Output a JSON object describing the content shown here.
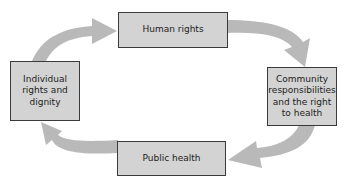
{
  "colors": {
    "background": "#ffffff",
    "box_fill": "#d3d3d3",
    "box_border": "#3a3a3a",
    "arrow": "#b9b9b9",
    "text": "#222222"
  },
  "nodes": [
    {
      "id": "human-rights",
      "label": "Human rights"
    },
    {
      "id": "community",
      "label": "Community responsibilities and the right to health",
      "lines": [
        "Community",
        "responsibilities",
        "and the right",
        "to health"
      ]
    },
    {
      "id": "public-health",
      "label": "Public health"
    },
    {
      "id": "individual",
      "label": "Individual rights and dignity",
      "lines": [
        "Individual",
        "rights and",
        "dignity"
      ]
    }
  ],
  "edges": [
    {
      "from": "individual",
      "to": "human-rights"
    },
    {
      "from": "human-rights",
      "to": "community"
    },
    {
      "from": "community",
      "to": "public-health"
    },
    {
      "from": "public-health",
      "to": "individual"
    }
  ]
}
